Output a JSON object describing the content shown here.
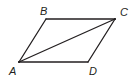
{
  "diagram": {
    "type": "parallelogram",
    "stroke_color": "#231f20",
    "vertices": [
      {
        "label": "A",
        "x": 19,
        "y": 62,
        "label_x": 9,
        "label_y": 75
      },
      {
        "label": "B",
        "x": 46,
        "y": 19,
        "label_x": 40,
        "label_y": 15
      },
      {
        "label": "C",
        "x": 115,
        "y": 19,
        "label_x": 120,
        "label_y": 16
      },
      {
        "label": "D",
        "x": 88,
        "y": 62,
        "label_x": 89,
        "label_y": 75
      }
    ],
    "sides": [
      [
        "A",
        "B"
      ],
      [
        "B",
        "C"
      ],
      [
        "C",
        "D"
      ],
      [
        "D",
        "A"
      ]
    ],
    "diagonals": [
      [
        "A",
        "C"
      ]
    ]
  }
}
